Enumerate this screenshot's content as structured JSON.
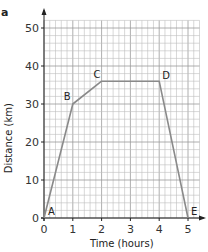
{
  "panel_label": "a",
  "chart_data": {
    "type": "line",
    "title": "",
    "xlabel": "Time (hours)",
    "ylabel": "Distance (km)",
    "xlim": [
      0,
      5.4
    ],
    "ylim": [
      0,
      52
    ],
    "x_ticks": [
      "0",
      "1",
      "2",
      "3",
      "4",
      "5"
    ],
    "y_ticks": [
      "0",
      "10",
      "20",
      "30",
      "40",
      "50"
    ],
    "grid": true,
    "minor_grid": {
      "x_step": 0.2,
      "y_step": 2
    },
    "series": [
      {
        "name": "journey",
        "color": "#8a8a8a",
        "points": [
          {
            "label": "A",
            "x": 0,
            "y": 0
          },
          {
            "label": "B",
            "x": 1,
            "y": 30
          },
          {
            "label": "C",
            "x": 2,
            "y": 36
          },
          {
            "label": "D",
            "x": 4,
            "y": 36
          },
          {
            "label": "E",
            "x": 5,
            "y": 0
          }
        ]
      }
    ]
  }
}
